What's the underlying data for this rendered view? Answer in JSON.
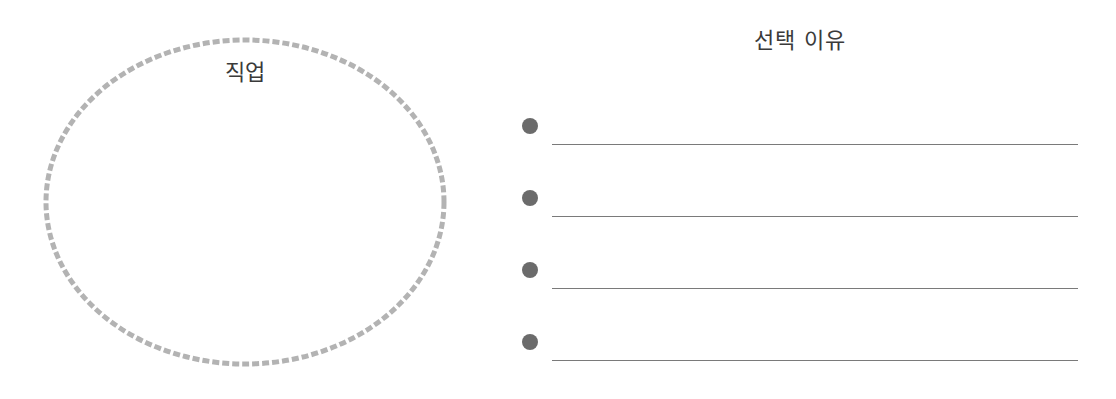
{
  "worksheet": {
    "left_panel": {
      "shape": "ellipse",
      "label": "직업",
      "border_color": "#b0b0b0",
      "border_style": "dashed"
    },
    "right_panel": {
      "title": "선택 이유",
      "bullets": [
        {
          "value": ""
        },
        {
          "value": ""
        },
        {
          "value": ""
        },
        {
          "value": ""
        }
      ],
      "bullet_color": "#6b6b6b",
      "line_color": "#7a7a7a"
    }
  }
}
